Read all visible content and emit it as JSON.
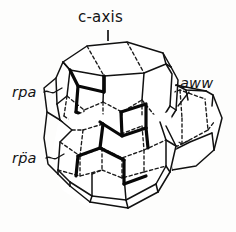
{
  "figure": {
    "kind": "crystal-polyhedron-line-drawing",
    "background_color": "#fdfdfc",
    "ink_color": "#111111",
    "labels": {
      "c_axis": "c-axis",
      "rpa_upper": "rpa",
      "rpa_lower": "rp̈a",
      "aww": "aww"
    },
    "line_styles": {
      "visible_edge": "solid",
      "hidden_edge": "dashed",
      "emphasized_edge": "bold"
    }
  }
}
